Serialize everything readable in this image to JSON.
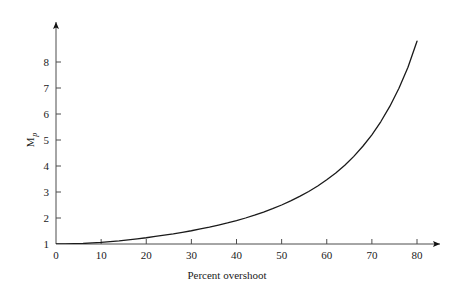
{
  "chart_data": {
    "type": "line",
    "title": "",
    "xlabel": "Percent overshoot",
    "ylabel": "Mp",
    "ylabel_base": "M",
    "ylabel_sub": "p",
    "xlim": [
      0,
      80
    ],
    "ylim": [
      1,
      8.4
    ],
    "xticks": [
      0,
      10,
      20,
      30,
      40,
      50,
      60,
      70,
      80
    ],
    "xtick_labels": [
      "0",
      "10",
      "20",
      "30",
      "40",
      "50",
      "60",
      "70",
      "80"
    ],
    "yticks": [
      1,
      2,
      3,
      4,
      5,
      6,
      7,
      8
    ],
    "ytick_labels": [
      "1",
      "2",
      "3",
      "4",
      "5",
      "6",
      "7",
      "8"
    ],
    "grid": false,
    "legend": null,
    "series": [
      {
        "name": "Resonant peak vs percent overshoot",
        "color": "#1a1a1a",
        "x": [
          0,
          2,
          4,
          6,
          8,
          10,
          12,
          14,
          16,
          18,
          20,
          22,
          24,
          26,
          28,
          30,
          32,
          34,
          36,
          38,
          40,
          42,
          44,
          46,
          48,
          50,
          52,
          54,
          56,
          58,
          60,
          62,
          64,
          66,
          68,
          70,
          72,
          74,
          76,
          78,
          80
        ],
        "y": [
          1.0,
          1.0,
          1.01,
          1.02,
          1.04,
          1.06,
          1.09,
          1.12,
          1.16,
          1.2,
          1.24,
          1.29,
          1.34,
          1.39,
          1.45,
          1.51,
          1.58,
          1.65,
          1.73,
          1.81,
          1.9,
          2.0,
          2.11,
          2.23,
          2.36,
          2.5,
          2.66,
          2.83,
          3.02,
          3.23,
          3.47,
          3.73,
          4.03,
          4.37,
          4.76,
          5.2,
          5.71,
          6.3,
          6.99,
          7.8,
          8.8
        ]
      }
    ],
    "axis_arrows": {
      "x": true,
      "y": true
    },
    "line_color": "#1a1a1a",
    "axis_color": "#4d4d4d"
  }
}
